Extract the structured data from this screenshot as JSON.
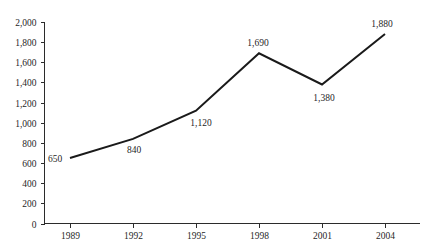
{
  "chart_data": {
    "type": "line",
    "title": "",
    "subtitle": "",
    "xlabel": "",
    "ylabel": "",
    "categories": [
      "1989",
      "1992",
      "1995",
      "1998",
      "2001",
      "2004"
    ],
    "x": [
      1989,
      1992,
      1995,
      1998,
      2001,
      2004
    ],
    "values": [
      650,
      840,
      1120,
      1690,
      1380,
      1880
    ],
    "point_labels": [
      "650",
      "840",
      "1,120",
      "1,690",
      "1,380",
      "1,880"
    ],
    "ylim": [
      0,
      2000
    ],
    "y_tick_step": 200,
    "y_ticks": [
      0,
      200,
      400,
      600,
      800,
      1000,
      1200,
      1400,
      1600,
      1800,
      2000
    ],
    "y_tick_labels": [
      "0",
      "200",
      "400",
      "600",
      "800",
      "1,000",
      "1,200",
      "1,400",
      "1,600",
      "1,800",
      "2,000"
    ],
    "x_tick_labels": [
      "1989",
      "1992",
      "1995",
      "1998",
      "2001",
      "2004"
    ],
    "grid": false,
    "legend": null,
    "markers": false,
    "series": [
      {
        "name": "",
        "values": [
          650,
          840,
          1120,
          1690,
          1380,
          1880
        ],
        "color": "#1a1a1a"
      }
    ],
    "colors": {
      "line": "#1a1a1a",
      "axis": "#2b2b2b",
      "text": "#1f1f1f",
      "background": "#ffffff"
    }
  }
}
